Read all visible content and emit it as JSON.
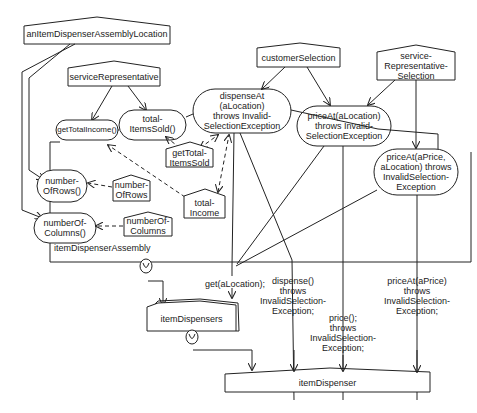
{
  "diagram": {
    "objects": {
      "location": "anItemDispenserAssemblyLocation",
      "service_rep": "serviceRepresentative",
      "customer_selection": "customerSelection",
      "service_rep_selection": "service-\nRepresentative-\nSelection",
      "get_total_items_sold_obj": "getTotal-\nItemsSold",
      "number_of_rows_obj": "number-\nOfRows",
      "number_of_columns_obj": "numberOf-\nColumns",
      "total_income_obj": "total-\nIncome",
      "item_dispensers": "itemDispensers",
      "item_dispenser": "itemDispenser"
    },
    "operations": {
      "total_items_sold": "total-\nItemsSold()",
      "get_total_income": "getTotalIncome()",
      "number_of_rows": "number-\nOfRows()",
      "number_of_columns": "numberOf-\nColumns()",
      "dispense_at": "dispenseAt\n(aLocation)\nthrows Invalid-\nSelectionException",
      "price_at_location": "priceAt(aLocation)\nthrows Invalid-\nSelectionException",
      "price_at_price": "priceAt(aPrice,\naLocation) throws\nInvalidSelection-\nException"
    },
    "assembly_label": "itemDispenserAssembly",
    "messages": {
      "get": "get(aLocation);",
      "dispense": "dispense()\nthrows\nInvalidSelection-\nException;",
      "price": "price();\nthrows\nInvalidSelection-\nException;",
      "price_at": "priceAt(aPrice)\nthrows\nInvalidSelection-\nException;"
    }
  }
}
